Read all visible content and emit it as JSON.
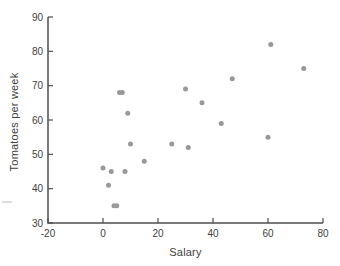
{
  "figure": {
    "width": 340,
    "height": 266,
    "background": "#ffffff"
  },
  "chart_data": {
    "type": "scatter",
    "title": "",
    "xlabel": "Salary",
    "ylabel": "Tomatoes per week",
    "xlim": [
      -20,
      80
    ],
    "ylim": [
      30,
      90
    ],
    "x_ticks": [
      -20,
      0,
      20,
      40,
      60,
      80
    ],
    "y_ticks": [
      30,
      40,
      50,
      60,
      70,
      80,
      90
    ],
    "grid": false,
    "legend": false,
    "points": [
      [
        0,
        46
      ],
      [
        2,
        41
      ],
      [
        3,
        45
      ],
      [
        4,
        35
      ],
      [
        5,
        35
      ],
      [
        6,
        68
      ],
      [
        7,
        68
      ],
      [
        8,
        45
      ],
      [
        9,
        62
      ],
      [
        10,
        53
      ],
      [
        15,
        48
      ],
      [
        25,
        53
      ],
      [
        30,
        69
      ],
      [
        31,
        52
      ],
      [
        36,
        65
      ],
      [
        43,
        59
      ],
      [
        47,
        72
      ],
      [
        60,
        55
      ],
      [
        61,
        82
      ],
      [
        73,
        75
      ]
    ]
  },
  "style": {
    "axis_color": "#4d4d4d",
    "tick_color": "#4d4d4d",
    "tick_label_color": "#3e3e3e",
    "point_color": "#989898",
    "point_radius": 2.5,
    "tick_length": 5,
    "tick_label_size": 10
  }
}
